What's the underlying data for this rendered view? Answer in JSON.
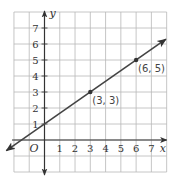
{
  "chart_data": {
    "type": "line",
    "title": "",
    "xlabel": "x",
    "ylabel": "y",
    "origin_label": "O",
    "xlim": [
      -2,
      8
    ],
    "ylim": [
      -2,
      8
    ],
    "grid": true,
    "x_ticks": [
      1,
      2,
      3,
      4,
      5,
      6,
      7
    ],
    "y_ticks": [
      1,
      2,
      3,
      4,
      5,
      6,
      7
    ],
    "x_tick_labels": [
      "1",
      "2",
      "3",
      "4",
      "5",
      "6",
      "7"
    ],
    "y_tick_labels": [
      "1",
      "2",
      "3",
      "4",
      "5",
      "6",
      "7"
    ],
    "line": {
      "equation": "y = (2/3)x + 1",
      "slope": 0.6667,
      "y_intercept": 1,
      "arrows_both_ends": true,
      "color": "#444444"
    },
    "points": [
      {
        "x": 3,
        "y": 3,
        "label": "(3, 3)"
      },
      {
        "x": 6,
        "y": 5,
        "label": "(6, 5)"
      }
    ],
    "colors": {
      "grid": "#b8b8b8",
      "axes": "#333333"
    }
  }
}
